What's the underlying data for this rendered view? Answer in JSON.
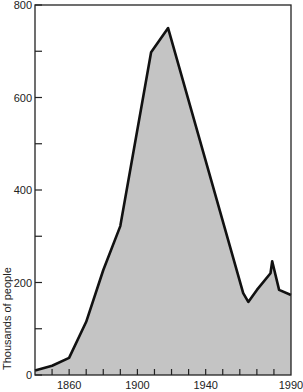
{
  "chart_data": {
    "type": "area",
    "title": "",
    "xlabel": "",
    "ylabel": "Thousands of people",
    "xlim": [
      1840,
      1990
    ],
    "ylim": [
      0,
      800
    ],
    "x_tick_labels": [
      "1860",
      "1900",
      "1940",
      "1990"
    ],
    "x_tick_values": [
      1860,
      1900,
      1940,
      1990
    ],
    "x_minor_ticks": [
      1850,
      1860,
      1870,
      1880,
      1890,
      1900,
      1910,
      1920,
      1930,
      1940,
      1950,
      1960,
      1970,
      1980
    ],
    "y_tick_labels": [
      "0",
      "200",
      "400",
      "600",
      "800"
    ],
    "y_tick_values": [
      0,
      200,
      400,
      600,
      800
    ],
    "y_minor_ticks": [
      100,
      300,
      500,
      700
    ],
    "grid": false,
    "legend": null,
    "fill_color": "#c4c4c4",
    "line_color": "#111111",
    "series": [
      {
        "name": "Thousands of people",
        "x": [
          1840,
          1850,
          1860,
          1870,
          1880,
          1890,
          1908,
          1918,
          1962,
          1965,
          1970,
          1978,
          1979,
          1983,
          1990
        ],
        "values": [
          10,
          20,
          37,
          115,
          227,
          322,
          698,
          750,
          177,
          158,
          184,
          220,
          246,
          184,
          173
        ]
      }
    ]
  }
}
